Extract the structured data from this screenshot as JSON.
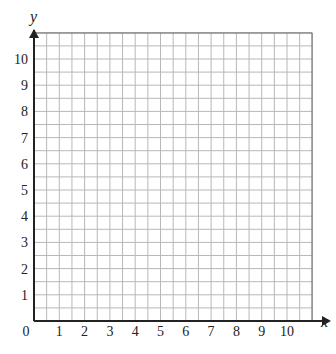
{
  "chart_data": {
    "type": "scatter",
    "title": "",
    "xlabel": "x",
    "ylabel": "y",
    "xlim": [
      0,
      11
    ],
    "ylim": [
      0,
      11
    ],
    "x_ticks": [
      "0",
      "1",
      "2",
      "3",
      "4",
      "5",
      "6",
      "7",
      "8",
      "9",
      "10"
    ],
    "y_ticks": [
      "1",
      "2",
      "3",
      "4",
      "5",
      "6",
      "7",
      "8",
      "9",
      "10"
    ],
    "grid": true,
    "grid_minor_step": 0.5,
    "series": [],
    "colors": {
      "grid": "#b8b8b8",
      "axis": "#222222",
      "border": "#555555"
    }
  }
}
